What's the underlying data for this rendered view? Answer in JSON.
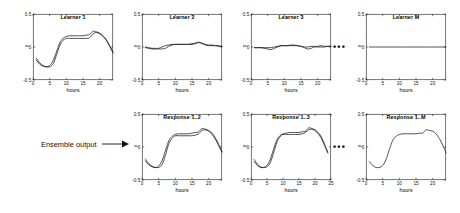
{
  "figure": {
    "annotation_label": "Ensemble output",
    "ellipsis": "•••",
    "axis_color": "#1a1a1a",
    "curve_color": "#1a1a1a"
  },
  "chart_data": [
    {
      "id": "learner-1",
      "type": "line",
      "title": "Learner 1",
      "xlabel": "hours",
      "ylabel": "y",
      "xlim": [
        0,
        24
      ],
      "ylim": [
        -0.5,
        0.5
      ],
      "xticks": [
        0,
        5,
        10,
        15,
        20
      ],
      "yticks": [
        -0.5,
        0,
        0.5
      ],
      "ytick_labels": [
        "-0.5",
        "0",
        "0.5"
      ],
      "grid": false,
      "legend": "none",
      "x": [
        1,
        2,
        3,
        4,
        5,
        6,
        7,
        8,
        9,
        10,
        11,
        12,
        13,
        14,
        15,
        16,
        17,
        18,
        19,
        20,
        21,
        22,
        23,
        24
      ],
      "series": [
        {
          "name": "curve-a",
          "values": [
            -0.2,
            -0.26,
            -0.29,
            -0.3,
            -0.28,
            -0.21,
            -0.08,
            0.06,
            0.13,
            0.16,
            0.17,
            0.17,
            0.17,
            0.17,
            0.17,
            0.18,
            0.19,
            0.24,
            0.23,
            0.21,
            0.17,
            0.11,
            0.02,
            -0.08
          ]
        },
        {
          "name": "curve-b",
          "values": [
            -0.17,
            -0.24,
            -0.28,
            -0.3,
            -0.3,
            -0.26,
            -0.13,
            0.02,
            0.1,
            0.13,
            0.13,
            0.13,
            0.13,
            0.13,
            0.13,
            0.13,
            0.14,
            0.2,
            0.22,
            0.2,
            0.16,
            0.1,
            0.01,
            -0.09
          ]
        }
      ]
    },
    {
      "id": "learner-2",
      "type": "line",
      "title": "Learner 2",
      "xlabel": "hours",
      "ylabel": "y",
      "xlim": [
        0,
        24
      ],
      "ylim": [
        -0.5,
        0.5
      ],
      "xticks": [
        0,
        5,
        10,
        15,
        20
      ],
      "yticks": [
        -0.5,
        0,
        0.5
      ],
      "ytick_labels": [
        "-0.5",
        "0",
        "0.5"
      ],
      "grid": false,
      "legend": "none",
      "x": [
        1,
        2,
        3,
        4,
        5,
        6,
        7,
        8,
        9,
        10,
        11,
        12,
        13,
        14,
        15,
        16,
        17,
        18,
        19,
        20,
        21,
        22,
        23,
        24
      ],
      "series": [
        {
          "name": "curve-a",
          "values": [
            0.0,
            -0.01,
            -0.02,
            -0.02,
            -0.02,
            0.0,
            0.02,
            0.03,
            0.04,
            0.04,
            0.04,
            0.04,
            0.04,
            0.04,
            0.05,
            0.06,
            0.07,
            0.05,
            0.04,
            0.03,
            0.03,
            0.02,
            0.02,
            0.01
          ]
        },
        {
          "name": "curve-b",
          "values": [
            -0.01,
            -0.02,
            -0.03,
            -0.03,
            -0.03,
            -0.03,
            -0.02,
            0.01,
            0.03,
            0.04,
            0.04,
            0.04,
            0.04,
            0.04,
            0.04,
            0.05,
            0.07,
            0.06,
            0.03,
            0.02,
            0.02,
            0.02,
            0.01,
            0.01
          ]
        }
      ]
    },
    {
      "id": "learner-3",
      "type": "line",
      "title": "Learner 3",
      "xlabel": "hours",
      "ylabel": "y",
      "xlim": [
        0,
        24
      ],
      "ylim": [
        -0.5,
        0.5
      ],
      "xticks": [
        0,
        5,
        10,
        15,
        20
      ],
      "yticks": [
        -0.5,
        0,
        0.5
      ],
      "ytick_labels": [
        "-0.5",
        "0",
        "0.5"
      ],
      "grid": false,
      "legend": "none",
      "x": [
        1,
        2,
        3,
        4,
        5,
        6,
        7,
        8,
        9,
        10,
        11,
        12,
        13,
        14,
        15,
        16,
        17,
        18,
        19,
        20,
        21,
        22,
        23,
        24
      ],
      "series": [
        {
          "name": "curve-a",
          "values": [
            -0.01,
            -0.01,
            -0.01,
            -0.01,
            -0.01,
            -0.01,
            0.0,
            0.01,
            0.02,
            0.02,
            0.02,
            0.03,
            0.03,
            0.02,
            0.01,
            0.0,
            0.0,
            0.01,
            0.01,
            0.01,
            0.02,
            0.01,
            0.01,
            0.01
          ]
        },
        {
          "name": "curve-b",
          "values": [
            -0.01,
            -0.01,
            -0.01,
            -0.02,
            -0.03,
            -0.04,
            -0.02,
            0.0,
            0.02,
            0.02,
            0.02,
            0.02,
            0.02,
            0.02,
            0.01,
            -0.01,
            -0.03,
            -0.02,
            0.0,
            0.0,
            0.0,
            0.0,
            0.01,
            0.01
          ]
        }
      ]
    },
    {
      "id": "learner-m",
      "type": "line",
      "title": "Learner M",
      "xlabel": "hours",
      "ylabel": "y",
      "xlim": [
        0,
        24
      ],
      "ylim": [
        -0.5,
        0.5
      ],
      "xticks": [
        0,
        5,
        10,
        15,
        20
      ],
      "yticks": [
        -0.5,
        0,
        0.5
      ],
      "ytick_labels": [
        "-0.5",
        "0",
        "0.5"
      ],
      "grid": false,
      "legend": "none",
      "x": [
        1,
        24
      ],
      "series": [
        {
          "name": "curve-a",
          "values": [
            0.0,
            0.0
          ]
        }
      ]
    },
    {
      "id": "response-1-2",
      "type": "line",
      "title": "Response 1..2",
      "xlabel": "hours",
      "ylabel": "y",
      "xlim": [
        0,
        24
      ],
      "ylim": [
        -0.5,
        0.5
      ],
      "xticks": [
        0,
        5,
        10,
        15,
        20
      ],
      "yticks": [
        -0.5,
        0,
        0.5
      ],
      "ytick_labels": [
        "-0.5",
        "0",
        "0.5"
      ],
      "grid": false,
      "legend": "none",
      "x": [
        1,
        2,
        3,
        4,
        5,
        6,
        7,
        8,
        9,
        10,
        11,
        12,
        13,
        14,
        15,
        16,
        17,
        18,
        19,
        20,
        21,
        22,
        23,
        24
      ],
      "series": [
        {
          "name": "curve-a",
          "values": [
            -0.21,
            -0.27,
            -0.3,
            -0.31,
            -0.29,
            -0.21,
            -0.06,
            0.09,
            0.16,
            0.19,
            0.2,
            0.2,
            0.2,
            0.2,
            0.21,
            0.22,
            0.23,
            0.28,
            0.27,
            0.25,
            0.21,
            0.14,
            0.04,
            -0.07
          ]
        },
        {
          "name": "curve-b",
          "values": [
            -0.18,
            -0.25,
            -0.29,
            -0.31,
            -0.31,
            -0.27,
            -0.13,
            0.04,
            0.13,
            0.17,
            0.17,
            0.17,
            0.17,
            0.17,
            0.17,
            0.18,
            0.2,
            0.25,
            0.26,
            0.24,
            0.19,
            0.12,
            0.02,
            -0.08
          ]
        }
      ]
    },
    {
      "id": "response-1-3",
      "type": "line",
      "title": "Response 1..3",
      "xlabel": "hours",
      "ylabel": "y",
      "xlim": [
        0,
        25
      ],
      "ylim": [
        -0.5,
        0.5
      ],
      "xticks": [
        0,
        5,
        10,
        15,
        20,
        25
      ],
      "yticks": [
        -0.5,
        0,
        0.5
      ],
      "ytick_labels": [
        "-0.5",
        "0",
        "0.5"
      ],
      "grid": false,
      "legend": "none",
      "x": [
        1,
        2,
        3,
        4,
        5,
        6,
        7,
        8,
        9,
        10,
        11,
        12,
        13,
        14,
        15,
        16,
        17,
        18,
        19,
        20,
        21,
        22,
        23,
        24
      ],
      "series": [
        {
          "name": "curve-a",
          "values": [
            -0.22,
            -0.28,
            -0.31,
            -0.31,
            -0.28,
            -0.19,
            -0.04,
            0.1,
            0.17,
            0.2,
            0.21,
            0.22,
            0.22,
            0.22,
            0.22,
            0.23,
            0.24,
            0.29,
            0.28,
            0.26,
            0.22,
            0.15,
            0.04,
            -0.08
          ]
        },
        {
          "name": "curve-b",
          "values": [
            -0.19,
            -0.26,
            -0.3,
            -0.31,
            -0.3,
            -0.24,
            -0.1,
            0.06,
            0.15,
            0.19,
            0.19,
            0.19,
            0.19,
            0.19,
            0.19,
            0.2,
            0.22,
            0.26,
            0.27,
            0.25,
            0.2,
            0.13,
            0.02,
            -0.09
          ]
        }
      ]
    },
    {
      "id": "response-1-m",
      "type": "line",
      "title": "Response 1..M",
      "xlabel": "hours",
      "ylabel": "y",
      "xlim": [
        0,
        24
      ],
      "ylim": [
        -0.5,
        0.5
      ],
      "xticks": [
        0,
        5,
        10,
        15,
        20
      ],
      "yticks": [
        -0.5,
        0,
        0.5
      ],
      "ytick_labels": [
        "-0.5",
        "0",
        "0.5"
      ],
      "grid": false,
      "legend": "none",
      "x": [
        1,
        2,
        3,
        4,
        5,
        6,
        7,
        8,
        9,
        10,
        11,
        12,
        13,
        14,
        15,
        16,
        17,
        18,
        19,
        20,
        21,
        22,
        23,
        24
      ],
      "series": [
        {
          "name": "curve-a",
          "values": [
            -0.22,
            -0.28,
            -0.31,
            -0.31,
            -0.28,
            -0.19,
            -0.04,
            0.1,
            0.16,
            0.19,
            0.2,
            0.2,
            0.2,
            0.2,
            0.2,
            0.21,
            0.21,
            0.26,
            0.25,
            0.24,
            0.2,
            0.13,
            0.03,
            -0.09
          ]
        }
      ]
    }
  ]
}
